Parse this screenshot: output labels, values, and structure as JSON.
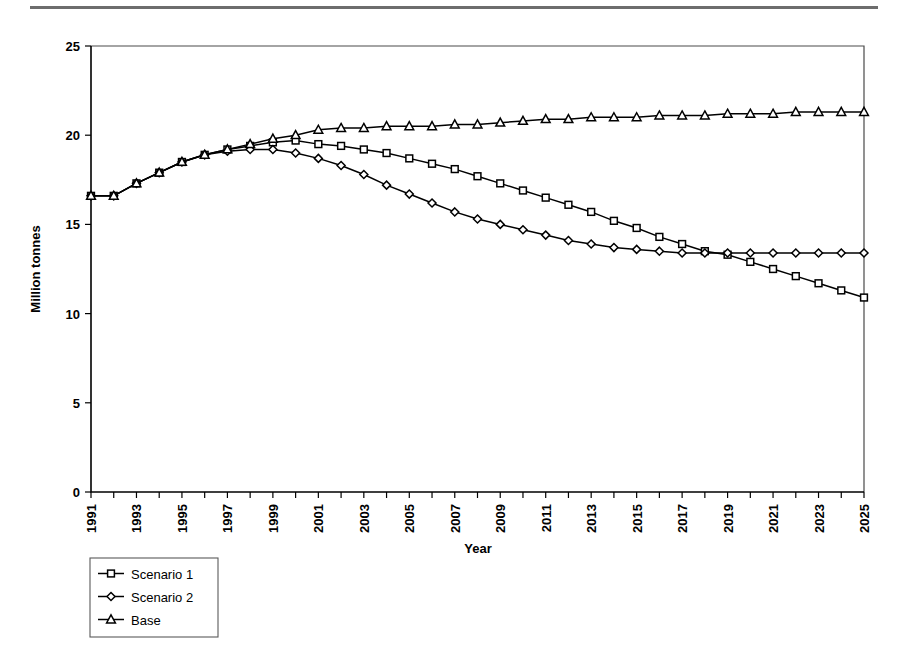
{
  "page": {
    "background_color": "#ffffff",
    "rule_color": "#6d6d6d"
  },
  "chart_data": {
    "type": "line",
    "title": "",
    "xlabel": "Year",
    "ylabel": "Million tonnes",
    "xlim": [
      1991,
      2025
    ],
    "ylim": [
      0,
      25
    ],
    "yticks": [
      0,
      5,
      10,
      15,
      20,
      25
    ],
    "ytick_labels": [
      "0",
      "5",
      "10",
      "15",
      "20",
      "25"
    ],
    "grid": false,
    "legend_position": "bottom-left",
    "x_tick_interval": 1,
    "x_label_interval": 2,
    "x": [
      1991,
      1992,
      1993,
      1994,
      1995,
      1996,
      1997,
      1998,
      1999,
      2000,
      2001,
      2002,
      2003,
      2004,
      2005,
      2006,
      2007,
      2008,
      2009,
      2010,
      2011,
      2012,
      2013,
      2014,
      2015,
      2016,
      2017,
      2018,
      2019,
      2020,
      2021,
      2022,
      2023,
      2024,
      2025
    ],
    "xtick_labels": [
      "1991",
      "",
      "1993",
      "",
      "1995",
      "",
      "1997",
      "",
      "1999",
      "",
      "2001",
      "",
      "2003",
      "",
      "2005",
      "",
      "2007",
      "",
      "2009",
      "",
      "2011",
      "",
      "2013",
      "",
      "2015",
      "",
      "2017",
      "",
      "2019",
      "",
      "2021",
      "",
      "2023",
      "",
      "2025"
    ],
    "series": [
      {
        "name": "Scenario 1",
        "marker": "square",
        "values": [
          16.6,
          16.6,
          17.3,
          17.9,
          18.5,
          18.9,
          19.2,
          19.4,
          19.6,
          19.7,
          19.5,
          19.4,
          19.2,
          19.0,
          18.7,
          18.4,
          18.1,
          17.7,
          17.3,
          16.9,
          16.5,
          16.1,
          15.7,
          15.2,
          14.8,
          14.3,
          13.9,
          13.5,
          13.3,
          12.9,
          12.5,
          12.1,
          11.7,
          11.3,
          10.9
        ]
      },
      {
        "name": "Scenario 2",
        "marker": "diamond",
        "values": [
          16.6,
          16.6,
          17.3,
          17.9,
          18.5,
          18.9,
          19.1,
          19.2,
          19.2,
          19.0,
          18.7,
          18.3,
          17.8,
          17.2,
          16.7,
          16.2,
          15.7,
          15.3,
          15.0,
          14.7,
          14.4,
          14.1,
          13.9,
          13.7,
          13.6,
          13.5,
          13.4,
          13.4,
          13.4,
          13.4,
          13.4,
          13.4,
          13.4,
          13.4,
          13.4
        ]
      },
      {
        "name": "Base",
        "marker": "triangle",
        "values": [
          16.6,
          16.6,
          17.3,
          17.9,
          18.5,
          18.9,
          19.2,
          19.5,
          19.8,
          20.0,
          20.3,
          20.4,
          20.4,
          20.5,
          20.5,
          20.5,
          20.6,
          20.6,
          20.7,
          20.8,
          20.9,
          20.9,
          21.0,
          21.0,
          21.0,
          21.1,
          21.1,
          21.1,
          21.2,
          21.2,
          21.2,
          21.3,
          21.3,
          21.3,
          21.3
        ]
      }
    ]
  },
  "legend": {
    "entries": [
      {
        "label": "Scenario 1",
        "marker": "square"
      },
      {
        "label": "Scenario 2",
        "marker": "diamond"
      },
      {
        "label": "Base",
        "marker": "triangle"
      }
    ]
  }
}
